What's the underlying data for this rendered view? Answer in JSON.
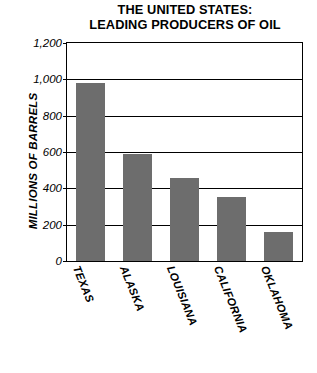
{
  "chart_data": {
    "type": "bar",
    "title": "THE UNITED STATES: LEADING PRODUCERS OF OIL",
    "title_lines": [
      "THE UNITED STATES:",
      "LEADING PRODUCERS OF OIL"
    ],
    "categories": [
      "TEXAS",
      "ALASKA",
      "LOUISIANA",
      "CALIFORNIA",
      "OKLAHOMA"
    ],
    "values": [
      980,
      590,
      455,
      350,
      160
    ],
    "xlabel": "",
    "ylabel": "MILLIONS OF BARRELS",
    "ylim": [
      0,
      1200
    ],
    "yticks": [
      0,
      200,
      400,
      600,
      800,
      1000,
      1200
    ],
    "ytick_labels": [
      "0",
      "200",
      "400",
      "600",
      "800",
      "1,000",
      "1,200"
    ],
    "grid": true,
    "legend": "none",
    "bar_color": "#6d6d6d",
    "axis_color": "#000000"
  }
}
